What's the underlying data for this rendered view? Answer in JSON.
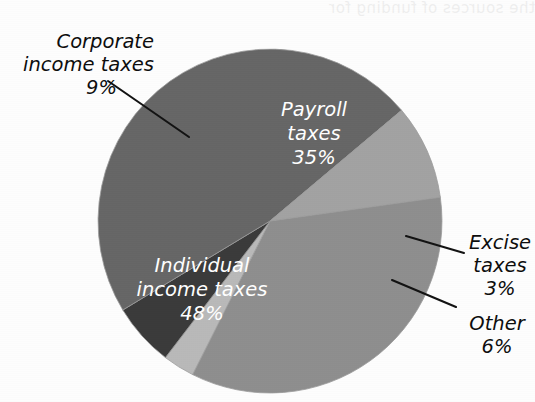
{
  "page": {
    "background_color": "#fdfdfd",
    "width": 535,
    "height": 402,
    "bleed_through_text": "the sources of funding for"
  },
  "chart_data": {
    "type": "pie",
    "title": "",
    "subtitle": "",
    "xlabel": "",
    "ylabel": "",
    "grid": false,
    "legend_position": "none",
    "labels_inside_slices": true,
    "start_angle_deg": -8,
    "direction": "clockwise",
    "center": {
      "x": 270,
      "y": 221
    },
    "radius": 172,
    "categories": [
      "Payroll taxes",
      "Excise taxes",
      "Other",
      "Individual income taxes",
      "Corporate income taxes"
    ],
    "values": [
      35,
      3,
      6,
      48,
      9
    ],
    "units": "percent",
    "total": 101,
    "slices": [
      {
        "name": "payroll-taxes",
        "label_line1": "Payroll",
        "label_line2": "taxes",
        "value_text": "35%",
        "value": 35,
        "color": "#8e8e8e",
        "label_placement": "inside",
        "label_color": "#ffffff"
      },
      {
        "name": "excise-taxes",
        "label_line1": "Excise",
        "label_line2": "taxes",
        "value_text": "3%",
        "value": 3,
        "color": "#b9b9b9",
        "label_placement": "outside",
        "label_color": "#0d0d0d"
      },
      {
        "name": "other",
        "label_line1": "Other",
        "label_line2": "",
        "value_text": "6%",
        "value": 6,
        "color": "#3a3a3a",
        "label_placement": "outside",
        "label_color": "#0d0d0d"
      },
      {
        "name": "individual-income-taxes",
        "label_line1": "Individual",
        "label_line2": "income taxes",
        "value_text": "48%",
        "value": 48,
        "color": "#666666",
        "label_placement": "inside",
        "label_color": "#ffffff"
      },
      {
        "name": "corporate-income-taxes",
        "label_line1": "Corporate",
        "label_line2": "income taxes",
        "value_text": "9%",
        "value": 9,
        "color": "#a2a2a2",
        "label_placement": "outside",
        "label_color": "#0d0d0d"
      }
    ]
  },
  "labels": {
    "corporate": {
      "line1": "Corporate",
      "line2": "income taxes",
      "percent": "9%"
    },
    "payroll": {
      "line1": "Payroll",
      "line2": "taxes",
      "percent": "35%"
    },
    "excise": {
      "line1": "Excise",
      "line2": "taxes",
      "percent": "3%"
    },
    "other": {
      "line1": "Other",
      "line2": "",
      "percent": "6%"
    },
    "individual": {
      "line1": "Individual",
      "line2": "income taxes",
      "percent": "48%"
    }
  }
}
